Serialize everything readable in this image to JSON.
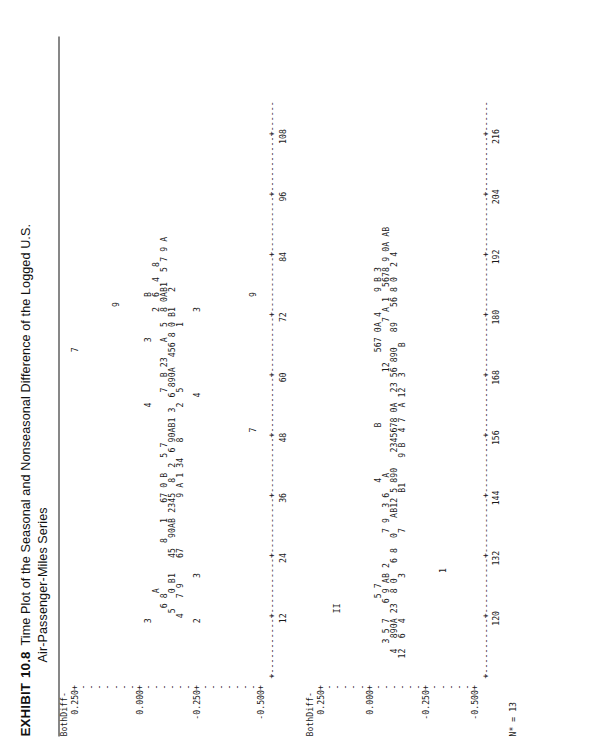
{
  "exhibit": {
    "label": "EXHIBIT",
    "number": "10.8",
    "title_line1": "Time Plot of the Seasonal and Nonseasonal Difference of the Logged U.S.",
    "title_line2": "Air-Passenger-Miles Series"
  },
  "footer": {
    "n_missing": "N* = 13"
  },
  "chart_data": {
    "type": "scatter",
    "title": "Time Plot of the Seasonal and Nonseasonal Difference of the Logged U.S. Air-Passenger-Miles Series",
    "subtitle": "MINITAB character time-series plot (two stacked panels)",
    "ylabel": "BothDiff",
    "xlabel": "",
    "grid": false,
    "legend": "none",
    "note": "Plot symbols are month codes: 1-9 = Jan-Sep, 0 = Oct, A = Nov, B = Dec",
    "symbol_legend": [
      {
        "symbol": "1",
        "meaning": "January"
      },
      {
        "symbol": "2",
        "meaning": "February"
      },
      {
        "symbol": "3",
        "meaning": "March"
      },
      {
        "symbol": "4",
        "meaning": "April"
      },
      {
        "symbol": "5",
        "meaning": "May"
      },
      {
        "symbol": "6",
        "meaning": "June"
      },
      {
        "symbol": "7",
        "meaning": "July"
      },
      {
        "symbol": "8",
        "meaning": "August"
      },
      {
        "symbol": "9",
        "meaning": "September"
      },
      {
        "symbol": "0",
        "meaning": "October"
      },
      {
        "symbol": "A",
        "meaning": "November"
      },
      {
        "symbol": "B",
        "meaning": "December"
      }
    ],
    "panels": [
      {
        "name": "panel-1",
        "axis_name": "BothDiff-",
        "ylim": [
          -0.5,
          0.25
        ],
        "yticks": [
          "0.250+",
          "0.000+",
          "-0.250+",
          "-0.500+"
        ],
        "ytick_values": [
          0.25,
          0.0,
          -0.25,
          -0.5
        ],
        "xlim": [
          0,
          114
        ],
        "xticks": [
          "12",
          "24",
          "36",
          "48",
          "60",
          "72",
          "84",
          "96",
          "108"
        ],
        "xtick_values": [
          12,
          24,
          36,
          48,
          60,
          72,
          84,
          96,
          108
        ]
      },
      {
        "name": "panel-2",
        "axis_name": "BothDiff-",
        "ylim": [
          -0.5,
          0.25
        ],
        "yticks": [
          "0.250+",
          "0.000+",
          "-0.250+",
          "-0.500+"
        ],
        "ytick_values": [
          0.25,
          0.0,
          -0.25,
          -0.5
        ],
        "xlim": [
          114,
          222
        ],
        "xticks": [
          "120",
          "132",
          "144",
          "156",
          "168",
          "180",
          "192",
          "204",
          "216"
        ],
        "xtick_values": [
          120,
          132,
          144,
          156,
          168,
          180,
          192,
          204,
          216
        ]
      }
    ],
    "panel_1_rows": [
      "                                                                 7",
      "",
      "",
      "",
      "",
      "                                                                          9",
      "",
      "",
      "",
      "           3                                          4            3        B",
      "                 A                                                       2  6  4  8",
      "              6 8          8   1   67 0 B   5 7          7  B 23   A  5  8 0AB1  5 7 9 A",
      "             5   0 B1   45  90AB 2345  8  2  6 90AB1 3  6 890A  456 8 0 B1   2",
      "            4   7 9     67          9 A 1 34   8      2  5            1",
      "",
      "           2        3                                   4                3",
      "",
      "",
      "",
      "",
      "",
      "",
      "                                                 7                          9",
      ""
    ],
    "panel_2_rows": [
      "",
      "",
      "             II",
      "",
      "",
      "",
      "",
      "                5 7                    4          B              567 0A 4    9 B 3",
      "       3 5 7   6 9 AB 2      7 9  3 6   A                    12        7 A 1  5678 9 0A AB",
      "     4  890A 23  8 0   6 8  0   AB12 5 890   2345678 0A  23 56 890   89   56 8 0  2 4",
      "    12  6  4        3        7       B1     9 B  4 7  A 12  3     B",
      "",
      "",
      "",
      "",
      "                     1",
      "",
      "",
      "",
      ""
    ]
  }
}
